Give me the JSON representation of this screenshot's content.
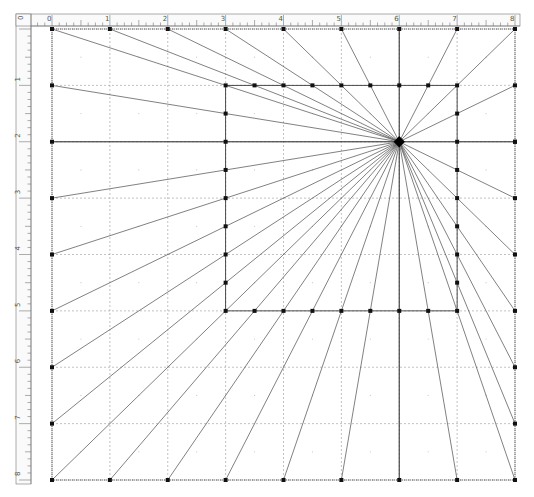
{
  "diagram": {
    "type": "one-point-perspective-construction",
    "canvas": {
      "width": 534,
      "height": 497,
      "background": "#ffffff"
    },
    "grid": {
      "units_x": 8,
      "units_y": 8,
      "origin_px": [
        52,
        29
      ],
      "unit_px": [
        57.875,
        56.375
      ],
      "major_line_color": "#9a9a9a",
      "minor_dot_color": "#c8c8c8"
    },
    "rulers": {
      "top": {
        "labels": [
          "0",
          "1",
          "2",
          "3",
          "4",
          "5",
          "6",
          "7",
          "8"
        ]
      },
      "left": {
        "labels": [
          "0",
          "1",
          "2",
          "3",
          "4",
          "5",
          "6",
          "7",
          "8"
        ]
      },
      "corner_label": "0",
      "ticks_per_unit": 8,
      "color": "#777777"
    },
    "vanishing_point": {
      "x": 6,
      "y": 2,
      "label": ""
    },
    "outer_frame": {
      "x0": 0,
      "y0": 0,
      "x1": 8,
      "y1": 8,
      "point_step": 1
    },
    "inner_rect": {
      "x0": 3,
      "y0": 1,
      "x1": 7,
      "y1": 5,
      "point_step": 0.5
    },
    "guide_lines": [
      {
        "from": [
          0,
          2
        ],
        "to": [
          8,
          2
        ]
      },
      {
        "from": [
          6,
          0
        ],
        "to": [
          6,
          8
        ]
      }
    ],
    "style": {
      "ray_color": "#4a4a4a",
      "edge_color": "#3a3a3a",
      "point_color": "#111111",
      "point_size": 4
    }
  }
}
